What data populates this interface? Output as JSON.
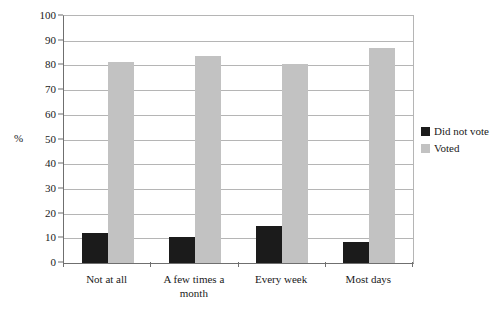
{
  "chart_data": {
    "type": "bar",
    "title": "",
    "subtitle": "",
    "xlabel": "",
    "ylabel": "%",
    "ylim": [
      0,
      100
    ],
    "ytick_step": 10,
    "yticks": [
      100,
      90,
      80,
      70,
      60,
      50,
      40,
      30,
      20,
      10,
      0
    ],
    "ytick_labels": [
      "100",
      "90",
      "80",
      "70",
      "60",
      "50",
      "40",
      "30",
      "20",
      "10",
      "0"
    ],
    "grid": true,
    "grid_axis": "y",
    "legend_position": "right",
    "categories": [
      "Not at all",
      "A few times a month",
      "Every week",
      "Most days"
    ],
    "category_lines": [
      [
        "Not at all"
      ],
      [
        "A few times a",
        "month"
      ],
      [
        "Every week"
      ],
      [
        "Most days"
      ]
    ],
    "series": [
      {
        "name": "Did not vote",
        "color": "#1b1b1b",
        "values": [
          12,
          10.5,
          15,
          8.5
        ]
      },
      {
        "name": "Voted",
        "color": "#c2c2c2",
        "values": [
          81.5,
          84,
          80.5,
          87
        ]
      }
    ]
  },
  "legend": {
    "items": [
      {
        "label": "Did not vote",
        "color": "#1b1b1b"
      },
      {
        "label": "Voted",
        "color": "#c2c2c2"
      }
    ]
  },
  "axis": {
    "y_title": "%"
  },
  "colors": {
    "did_not_vote": "#1b1b1b",
    "voted": "#c2c2c2",
    "gridline": "#b5b5b5",
    "axis": "#6f6f6f",
    "background": "#ffffff"
  }
}
